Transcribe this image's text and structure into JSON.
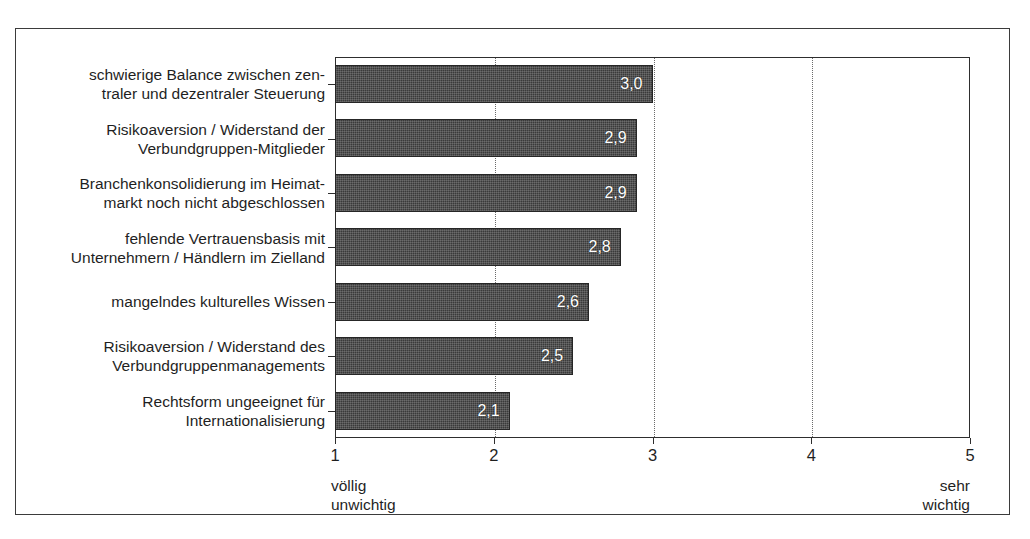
{
  "figure": {
    "scan_remnant_text": "",
    "axis_note": ""
  },
  "chart_data": {
    "type": "bar",
    "orientation": "horizontal",
    "title": "",
    "xlabel": "",
    "ylabel": "",
    "xlim": [
      1,
      5
    ],
    "grid": true,
    "gridlines_at": [
      2,
      3,
      4
    ],
    "legend_position": "none",
    "tick_labels": [
      "1",
      "2",
      "3",
      "4",
      "5"
    ],
    "tick_values": [
      1,
      2,
      3,
      4,
      5
    ],
    "scale_anchor_low": "völlig\nunwichtig",
    "scale_anchor_high": "sehr\nwichtig",
    "value_decimal_separator": ",",
    "bar_color": "#3a3a3a",
    "value_label_color": "#ffffff",
    "categories": [
      "schwierige Balance zwischen zen-\ntraler und dezentraler Steuerung",
      "Risikoaversion / Widerstand der\nVerbundgruppen-Mitglieder",
      "Branchenkonsolidierung im Heimat-\nmarkt noch nicht abgeschlossen",
      "fehlende Vertrauensbasis mit\nUnternehmern / Händlern im Zielland",
      "mangelndes kulturelles Wissen",
      "Risikoaversion / Widerstand des\nVerbundgruppenmanagements",
      "Rechtsform ungeeignet für\nInternationalisierung"
    ],
    "values": [
      3.0,
      2.9,
      2.9,
      2.8,
      2.6,
      2.5,
      2.1
    ],
    "value_labels": [
      "3,0",
      "2,9",
      "2,9",
      "2,8",
      "2,6",
      "2,5",
      "2,1"
    ]
  }
}
